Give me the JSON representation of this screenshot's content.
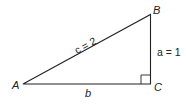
{
  "diagram": {
    "type": "right-triangle",
    "vertices": {
      "A": {
        "label": "A"
      },
      "B": {
        "label": "B"
      },
      "C": {
        "label": "C"
      }
    },
    "sides": {
      "hypotenuse": {
        "label": "c = 2"
      },
      "vertical": {
        "label": "a = 1"
      },
      "base": {
        "label": "b"
      }
    },
    "right_angle_at": "C",
    "stroke_color": "#222222"
  }
}
